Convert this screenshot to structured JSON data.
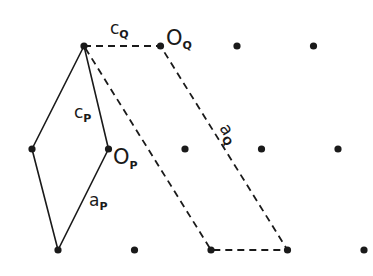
{
  "diagram": {
    "lattice_points": [
      {
        "row": 0,
        "col": 0
      },
      {
        "row": 0,
        "col": 1
      },
      {
        "row": 0,
        "col": 2
      },
      {
        "row": 0,
        "col": 3
      },
      {
        "row": 1,
        "col": 0
      },
      {
        "row": 1,
        "col": 1
      },
      {
        "row": 1,
        "col": 2
      },
      {
        "row": 1,
        "col": 3
      },
      {
        "row": 1,
        "col": 4
      },
      {
        "row": 2,
        "col": 0
      },
      {
        "row": 2,
        "col": 1
      },
      {
        "row": 2,
        "col": 2
      },
      {
        "row": 2,
        "col": 3
      },
      {
        "row": 2,
        "col": 4
      }
    ],
    "cell_P": {
      "style": "solid",
      "vertices": [
        "r0c0",
        "r1c0",
        "r2c0",
        "r1c1"
      ]
    },
    "cell_Q": {
      "style": "dashed",
      "vertices": [
        "r0c0",
        "r0c1",
        "r2c3",
        "r2c2"
      ]
    },
    "labels": {
      "cQ": {
        "main": "c",
        "sub": "Q"
      },
      "OQ": {
        "main": "O",
        "sub": "Q"
      },
      "cP": {
        "main": "c",
        "sub": "P"
      },
      "OP": {
        "main": "O",
        "sub": "P"
      },
      "aQ": {
        "main": "a",
        "sub": "Q"
      },
      "aP": {
        "main": "a",
        "sub": "P"
      }
    }
  }
}
